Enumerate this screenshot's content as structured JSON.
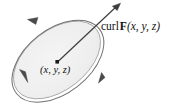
{
  "figure": {
    "type": "diagram",
    "background_color": "#ffffff",
    "surface": {
      "name": "disk",
      "fill_color": "#efefef",
      "stroke_color": "#9a9a9a",
      "center_x": 57,
      "center_y": 60,
      "radius_x": 50,
      "radius_y": 30,
      "rotation_deg": -38
    },
    "circulation": {
      "name": "circulation-arrows",
      "direction": "counterclockwise",
      "stroke_color": "#6d6d6d",
      "arrowhead_count": 3,
      "arrowhead_positions": [
        {
          "x": 31,
          "y": 19
        },
        {
          "x": 27,
          "y": 81
        },
        {
          "x": 100,
          "y": 79
        }
      ]
    },
    "curl_vector": {
      "name": "curl-vector-arrow",
      "stroke_color": "#3d3d3d",
      "tail_x": 57,
      "tail_y": 62,
      "tip_x": 120,
      "tip_y": 4
    },
    "point_marker": {
      "name": "point-marker",
      "x": 57,
      "y": 62,
      "color": "#1a1a1a"
    },
    "labels": {
      "curl": {
        "operator": "curl",
        "field": "F",
        "arguments": "(x, y, z)",
        "full_text": "curl F(x, y, z)"
      },
      "point": {
        "full_text": "(x, y, z)",
        "coordinates": [
          "x",
          "y",
          "z"
        ]
      }
    }
  }
}
